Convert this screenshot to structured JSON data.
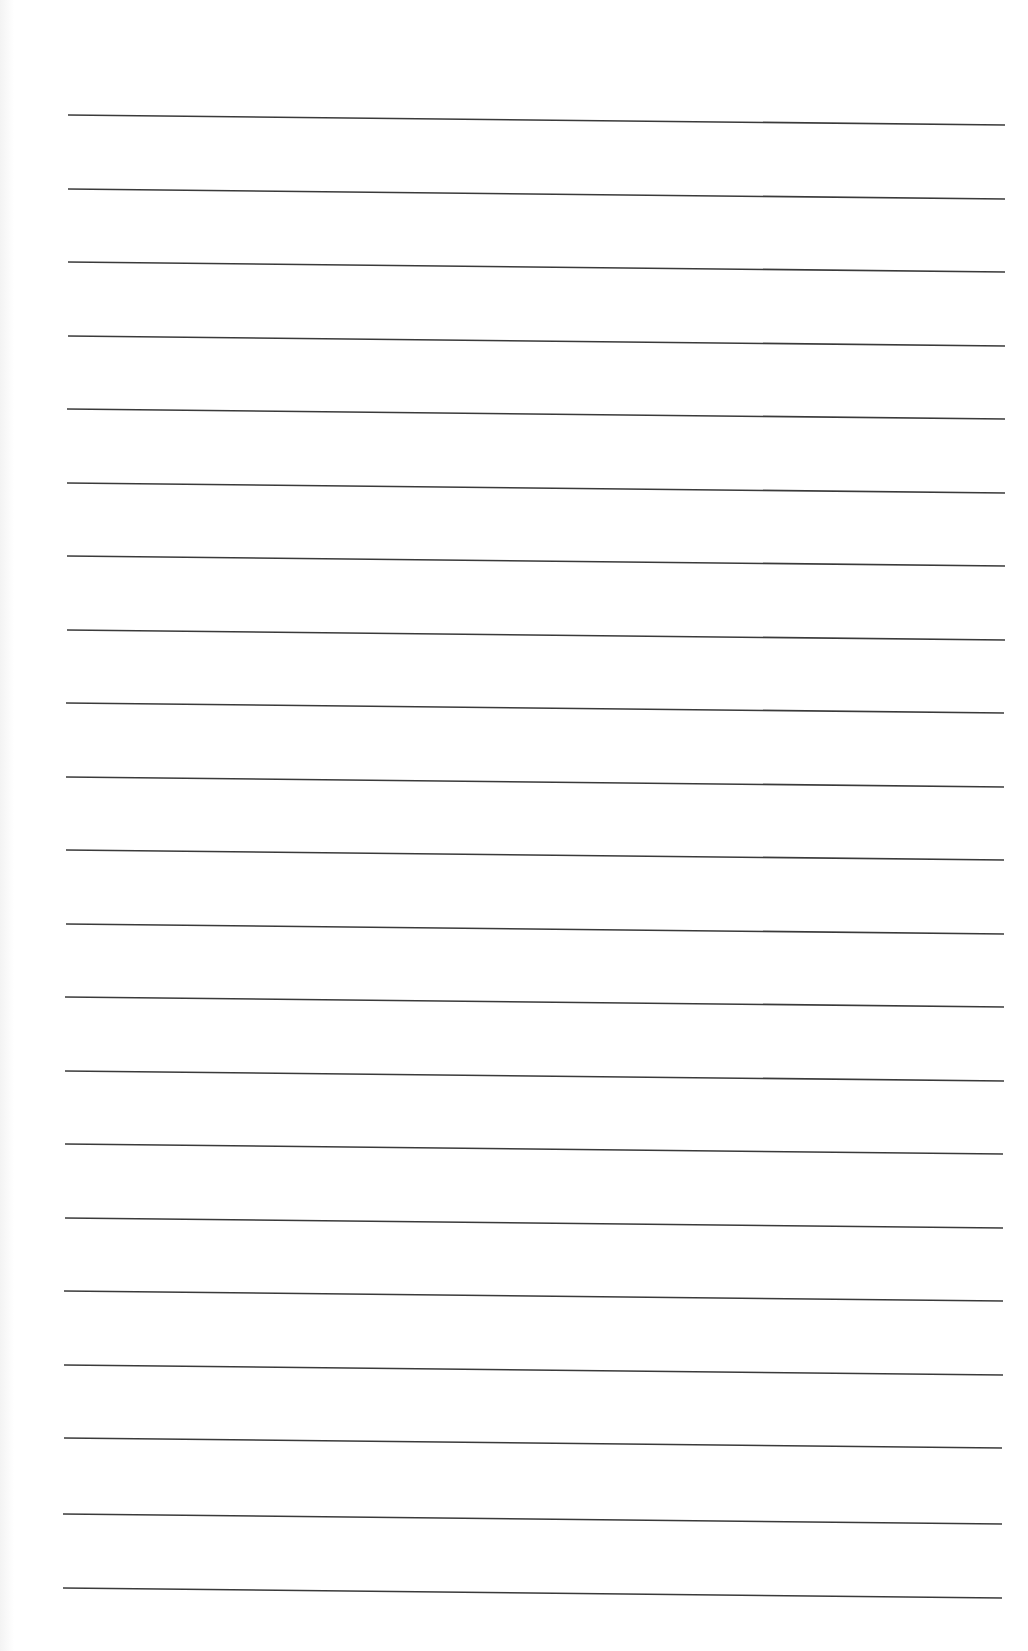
{
  "page": {
    "type": "lined-paper",
    "background_color": "#ffffff",
    "line_color": "#3a3a3a",
    "line_count": 21,
    "lines": [
      {
        "x1": 68,
        "y1": 115,
        "x2": 1005,
        "y2": 125
      },
      {
        "x1": 68,
        "y1": 189,
        "x2": 1005,
        "y2": 199
      },
      {
        "x1": 68,
        "y1": 262,
        "x2": 1005,
        "y2": 272
      },
      {
        "x1": 68,
        "y1": 336,
        "x2": 1005,
        "y2": 346
      },
      {
        "x1": 67,
        "y1": 409,
        "x2": 1005,
        "y2": 419
      },
      {
        "x1": 67,
        "y1": 483,
        "x2": 1005,
        "y2": 493
      },
      {
        "x1": 67,
        "y1": 556,
        "x2": 1005,
        "y2": 566
      },
      {
        "x1": 67,
        "y1": 630,
        "x2": 1005,
        "y2": 640
      },
      {
        "x1": 66,
        "y1": 703,
        "x2": 1004,
        "y2": 713
      },
      {
        "x1": 66,
        "y1": 777,
        "x2": 1004,
        "y2": 787
      },
      {
        "x1": 66,
        "y1": 850,
        "x2": 1004,
        "y2": 860
      },
      {
        "x1": 66,
        "y1": 924,
        "x2": 1004,
        "y2": 934
      },
      {
        "x1": 65,
        "y1": 997,
        "x2": 1004,
        "y2": 1007
      },
      {
        "x1": 65,
        "y1": 1071,
        "x2": 1004,
        "y2": 1081
      },
      {
        "x1": 65,
        "y1": 1144,
        "x2": 1003,
        "y2": 1154
      },
      {
        "x1": 65,
        "y1": 1218,
        "x2": 1003,
        "y2": 1228
      },
      {
        "x1": 64,
        "y1": 1291,
        "x2": 1003,
        "y2": 1301
      },
      {
        "x1": 64,
        "y1": 1365,
        "x2": 1003,
        "y2": 1375
      },
      {
        "x1": 64,
        "y1": 1438,
        "x2": 1002,
        "y2": 1448
      },
      {
        "x1": 63,
        "y1": 1514,
        "x2": 1002,
        "y2": 1524
      },
      {
        "x1": 63,
        "y1": 1588,
        "x2": 1002,
        "y2": 1598
      }
    ]
  }
}
